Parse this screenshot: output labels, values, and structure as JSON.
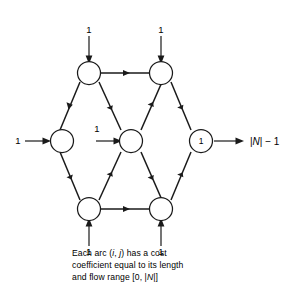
{
  "figure": {
    "node_labels": {
      "top_left": "",
      "top_right": "",
      "left": "",
      "center": "",
      "right": "1",
      "bottom_left": "",
      "bottom_right": ""
    },
    "supply_labels": {
      "top_left_supply": "1",
      "top_right_supply": "1",
      "left_supply": "1",
      "center_supply": "1",
      "bottom_left_supply": "1",
      "bottom_right_supply": "1"
    },
    "sink_label": {
      "prefix": "|",
      "symbol": "N",
      "suffix": "| − 1",
      "full": "|N| − 1"
    },
    "colors": {
      "stroke": "#1a1a1a",
      "node_fill": "#ffffff",
      "background": "#ffffff",
      "text": "#000000"
    }
  },
  "caption": {
    "line1_pre": "Each arc (",
    "line1_i": "i",
    "line1_mid": ", ",
    "line1_j": "j",
    "line1_post": ") has a cost",
    "line2": "coefficient equal to its length",
    "line3_pre": "and flow range [0, |",
    "line3_n": "N",
    "line3_post": "|]",
    "full_text": "Each arc (i, j) has a cost coefficient equal to its length and flow range [0, |N|]"
  }
}
